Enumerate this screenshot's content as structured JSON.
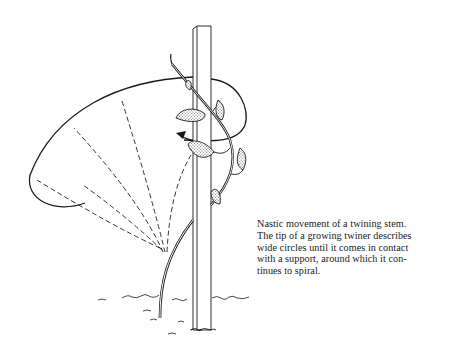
{
  "figure": {
    "title": "Nastic movement of a twining stem",
    "elements": [
      "support-pole",
      "twining-stem",
      "circumnutation-path",
      "dashed-prior-positions",
      "direction-arrow",
      "leaves",
      "ground"
    ],
    "colors": {
      "ink": "#1a1a1a",
      "background": "#ffffff",
      "leaf_fill": "#d9d9d9"
    }
  },
  "caption": {
    "lines": [
      "Nastic movement of a twining stem.",
      "The tip of a growing twiner describes",
      "wide circles until it comes in contact",
      "with a support, around which it con-",
      "tinues to spiral."
    ]
  }
}
